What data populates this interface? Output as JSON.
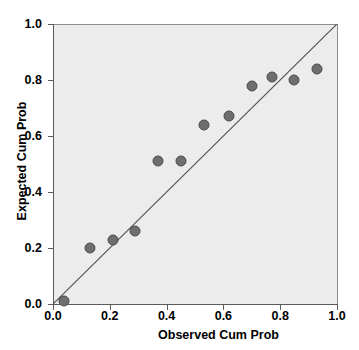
{
  "chart_data": {
    "type": "scatter",
    "title": "",
    "xlabel": "Observed Cum Prob",
    "ylabel": "Expected Cum Prob",
    "xlim": [
      0.0,
      1.0
    ],
    "ylim": [
      0.0,
      1.0
    ],
    "xticks": [
      "0.0",
      "0.2",
      "0.4",
      "0.6",
      "0.8",
      "1.0"
    ],
    "yticks": [
      "0.0",
      "0.2",
      "0.4",
      "0.6",
      "0.8",
      "1.0"
    ],
    "xtick_values": [
      0.0,
      0.2,
      0.4,
      0.6,
      0.8,
      1.0
    ],
    "ytick_values": [
      0.0,
      0.2,
      0.4,
      0.6,
      0.8,
      1.0
    ],
    "grid": false,
    "legend": null,
    "reference_line": {
      "type": "identity",
      "from": [
        0.0,
        0.0
      ],
      "to": [
        1.0,
        1.0
      ]
    },
    "plot_background": "#ececec",
    "marker_color": "#6e6e6e",
    "marker_edge_color": "#4a4a4a",
    "series": [
      {
        "name": "Normal P-P Plot",
        "x": [
          0.04,
          0.13,
          0.21,
          0.29,
          0.37,
          0.45,
          0.53,
          0.62,
          0.7,
          0.77,
          0.85,
          0.93
        ],
        "y": [
          0.01,
          0.2,
          0.23,
          0.26,
          0.51,
          0.51,
          0.64,
          0.67,
          0.78,
          0.81,
          0.8,
          0.84
        ]
      }
    ],
    "points": [
      {
        "x": 0.04,
        "y": 0.01
      },
      {
        "x": 0.13,
        "y": 0.2
      },
      {
        "x": 0.21,
        "y": 0.23
      },
      {
        "x": 0.29,
        "y": 0.26
      },
      {
        "x": 0.37,
        "y": 0.51
      },
      {
        "x": 0.45,
        "y": 0.51
      },
      {
        "x": 0.53,
        "y": 0.64
      },
      {
        "x": 0.62,
        "y": 0.67
      },
      {
        "x": 0.7,
        "y": 0.78
      },
      {
        "x": 0.77,
        "y": 0.81
      },
      {
        "x": 0.85,
        "y": 0.8
      },
      {
        "x": 0.93,
        "y": 0.84
      }
    ]
  },
  "title_remnant": ""
}
